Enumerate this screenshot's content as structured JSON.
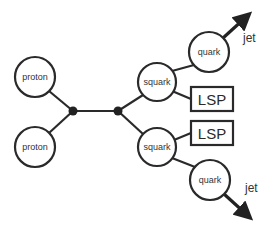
{
  "diagram": {
    "type": "particle-interaction",
    "colors": {
      "stroke": "#2a2a2a",
      "background": "#ffffff"
    },
    "nodes": {
      "proton_top": {
        "label": "proton"
      },
      "proton_bottom": {
        "label": "proton"
      },
      "squark_top": {
        "label": "squark"
      },
      "squark_bottom": {
        "label": "squark"
      },
      "quark_top": {
        "label": "quark"
      },
      "quark_bottom": {
        "label": "quark"
      },
      "lsp_top": {
        "label": "LSP"
      },
      "lsp_bottom": {
        "label": "LSP"
      }
    },
    "outputs": {
      "jet_top": {
        "label": "jet"
      },
      "jet_bottom": {
        "label": "jet"
      }
    }
  }
}
